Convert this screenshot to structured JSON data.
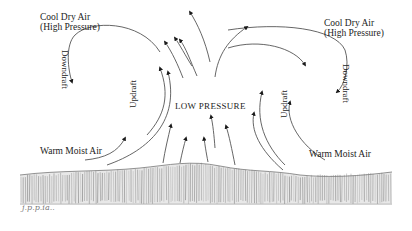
{
  "diagram": {
    "type": "atmospheric convection / thunderstorm cell",
    "labels": {
      "top_left": [
        "Cool Dry Air",
        "(High Pressure)"
      ],
      "top_right": [
        "Cool Dry Air",
        "(High Pressure)"
      ],
      "downdraft_left": "Downdraft",
      "downdraft_right": "Downdraft",
      "updraft_left": "Updraft",
      "updraft_right": "Updraft",
      "center": "LOW PRESSURE",
      "warm_left": "Warm Moist Air",
      "warm_right": "Warm Moist Air",
      "signature": "j.p.p.ia.."
    },
    "colors": {
      "ink": "#1c1c1c",
      "line": "#444444",
      "ground": "#6a6a6a",
      "background": "#ffffff"
    }
  }
}
